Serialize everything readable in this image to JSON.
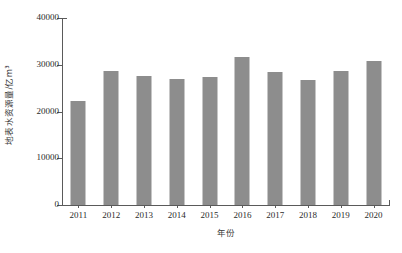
{
  "chart_data": {
    "type": "bar",
    "title": "",
    "subtitle": "",
    "xlabel": "年份",
    "ylabel": "地表水资源量/亿m³",
    "categories": [
      "2011",
      "2012",
      "2013",
      "2014",
      "2015",
      "2016",
      "2017",
      "2018",
      "2019",
      "2020"
    ],
    "values": [
      22200,
      28650,
      27550,
      26950,
      27450,
      31650,
      28450,
      26750,
      28650,
      30800
    ],
    "series": [
      {
        "name": "地表水资源量",
        "values": [
          22200,
          28650,
          27550,
          26950,
          27450,
          31650,
          28450,
          26750,
          28650,
          30800
        ]
      }
    ],
    "ylim": [
      0,
      40000
    ],
    "yticks": [
      0,
      10000,
      20000,
      30000,
      40000
    ],
    "ytick_labels": [
      "0",
      "10000",
      "20000",
      "30000",
      "40000"
    ],
    "xtick_labels": [
      "2011",
      "2012",
      "2013",
      "2014",
      "2015",
      "2016",
      "2017",
      "2018",
      "2019",
      "2020"
    ],
    "grid": false,
    "legend": false,
    "legend_position": "none",
    "bar_color": "#8d8d8d",
    "axis_color": "#5a5a5a",
    "background_color": "#ffffff",
    "annotations": []
  }
}
